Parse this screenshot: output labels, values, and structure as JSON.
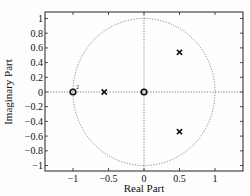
{
  "caption_fragment": "",
  "chart_data": {
    "type": "scatter",
    "title": "",
    "subtitle": "Pole-Zero Map",
    "xlabel": "Real Part",
    "ylabel": "Imaginary Part",
    "xlim": [
      -1.4,
      1.4
    ],
    "ylim": [
      -1.1,
      1.1
    ],
    "x_ticks": [
      -1,
      -0.5,
      0,
      0.5,
      1
    ],
    "x_tick_labels": [
      "−1",
      "−0.5",
      "0",
      "0.5",
      "1"
    ],
    "y_ticks": [
      1,
      0.8,
      0.6,
      0.4,
      0.2,
      0,
      -0.2,
      -0.4,
      -0.6,
      -0.8,
      -1
    ],
    "y_tick_labels": [
      "1",
      "0.8",
      "0.6",
      "0.4",
      "0.2",
      "0",
      "−0.2",
      "−0.4",
      "−0.6",
      "−0.8",
      "−1"
    ],
    "grid": false,
    "unit_circle": true,
    "series": [
      {
        "name": "zeros",
        "marker": "o",
        "points": [
          [
            -1,
            0
          ],
          [
            0,
            0
          ]
        ],
        "multiplicity": [
          2,
          1
        ]
      },
      {
        "name": "poles",
        "marker": "x",
        "points": [
          [
            -0.56,
            0
          ],
          [
            0.5,
            0.54
          ],
          [
            0.5,
            -0.54
          ]
        ]
      }
    ],
    "annotations": [
      {
        "text": "2",
        "x": -1,
        "y": 0,
        "note": "double zero"
      }
    ]
  }
}
